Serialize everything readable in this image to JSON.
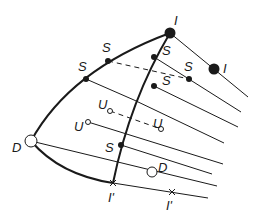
{
  "diagram": {
    "type": "phase-locus-diagram",
    "labels": {
      "I_top": "I",
      "I_right": "I",
      "S1": "S",
      "S2": "S",
      "S3": "S",
      "S4": "S",
      "S5": "S",
      "U1": "U",
      "U2": "U",
      "U3": "U",
      "D_big": "D",
      "D_small": "D",
      "Iprime_1": "I'",
      "Iprime_2": "I'"
    },
    "colors": {
      "line": "#1a1a1a",
      "background": "#ffffff"
    }
  }
}
